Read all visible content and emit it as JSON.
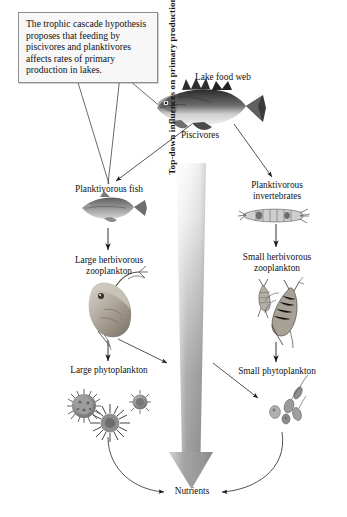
{
  "diagram": {
    "caption_box": {
      "text": "The trophic cascade hypothesis proposes that feeding by piscivores and planktivores affects rates of primary production in lakes."
    },
    "food_web_label": "Lake food web",
    "big_arrow": {
      "label": "Top-down influences on primary production",
      "direction": "downward",
      "color_top": "#f2f2f2",
      "color_bottom": "#9a9a9a"
    },
    "nodes": [
      {
        "id": "piscivores",
        "label": "Piscivores",
        "organism": "largemouth-bass-illustration",
        "column": "center"
      },
      {
        "id": "planktivorous-fish",
        "label": "Planktivorous fish",
        "organism": "minnow-illustration",
        "column": "left"
      },
      {
        "id": "large-zooplankton",
        "label": "Large herbivorous\nzooplankton",
        "organism": "daphnia-illustration",
        "column": "left"
      },
      {
        "id": "large-phytoplankton",
        "label": "Large phytoplankton",
        "organism": "colonial-algae-illustration",
        "column": "left"
      },
      {
        "id": "planktivorous-inverts",
        "label": "Planktivorous\ninvertebrates",
        "organism": "phantom-midge-larva-illustration",
        "column": "right"
      },
      {
        "id": "small-zooplankton",
        "label": "Small herbivorous\nzooplankton",
        "organism": "copepod-illustration",
        "column": "right"
      },
      {
        "id": "small-phytoplankton",
        "label": "Small phytoplankton",
        "organism": "small-algae-cells-illustration",
        "column": "right"
      },
      {
        "id": "nutrients",
        "label": "Nutrients",
        "organism": "",
        "column": "center"
      }
    ],
    "edges": [
      {
        "from": "piscivores",
        "to": "planktivorous-fish",
        "style": "arrow"
      },
      {
        "from": "piscivores",
        "to": "planktivorous-inverts",
        "style": "arrow"
      },
      {
        "from": "planktivorous-fish",
        "to": "large-zooplankton",
        "style": "arrow"
      },
      {
        "from": "planktivorous-inverts",
        "to": "small-zooplankton",
        "style": "arrow"
      },
      {
        "from": "large-zooplankton",
        "to": "large-phytoplankton",
        "style": "arrow"
      },
      {
        "from": "small-zooplankton",
        "to": "small-phytoplankton",
        "style": "arrow"
      },
      {
        "from": "large-zooplankton",
        "to": "small-phytoplankton",
        "style": "arrow-diagonal"
      },
      {
        "from": "small-zooplankton",
        "to": "large-phytoplankton",
        "style": "arrow-diagonal"
      },
      {
        "from": "large-phytoplankton",
        "to": "nutrients",
        "style": "curved-arrow"
      },
      {
        "from": "small-phytoplankton",
        "to": "nutrients",
        "style": "curved-arrow"
      },
      {
        "from": "caption_box",
        "to": "planktivorous-fish",
        "style": "leader-line"
      },
      {
        "from": "caption_box",
        "to": "piscivores",
        "style": "leader-line"
      }
    ]
  }
}
